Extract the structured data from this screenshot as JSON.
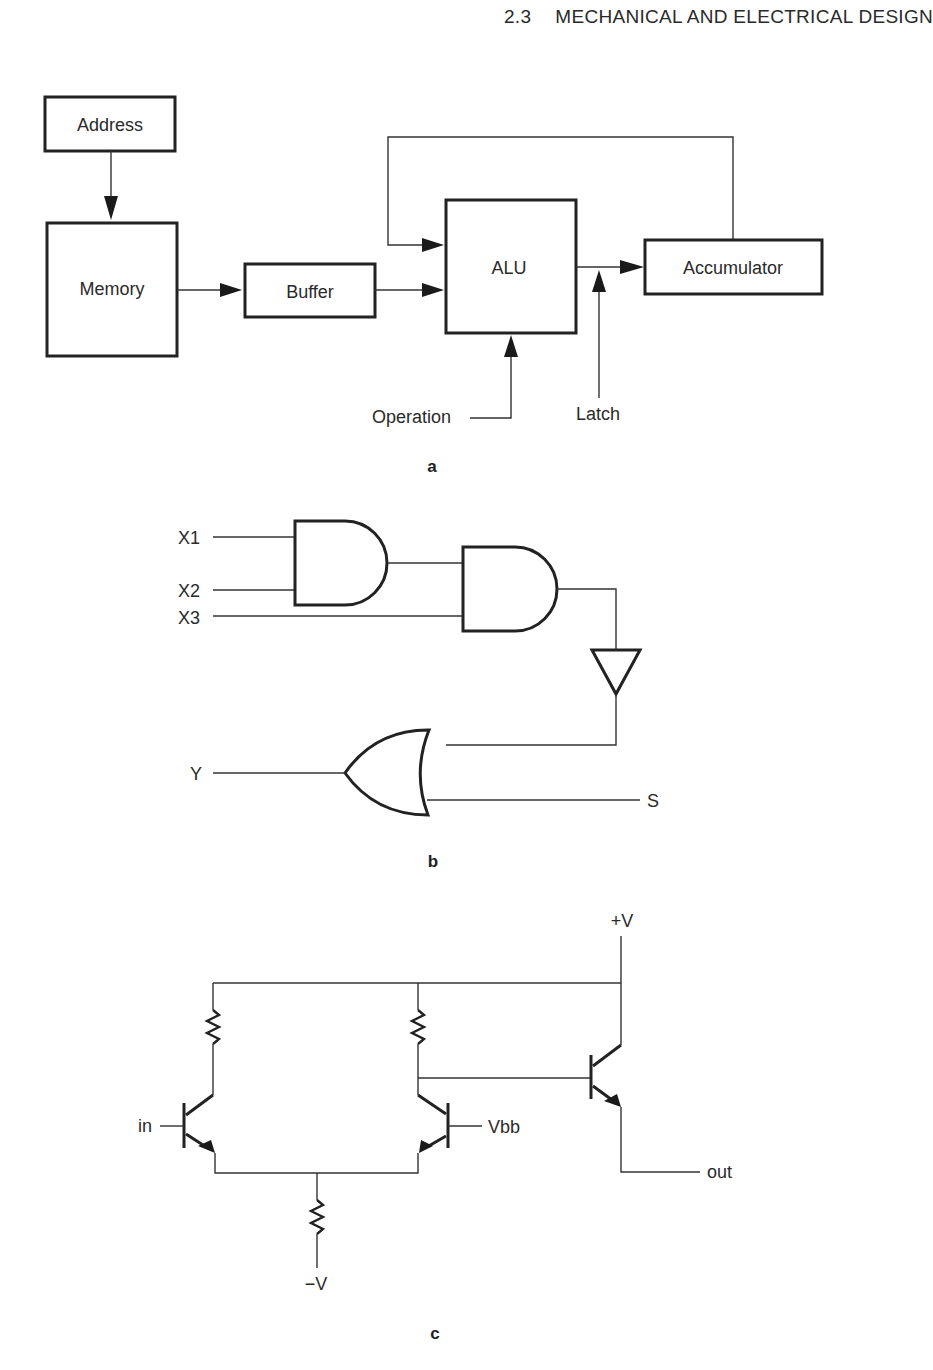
{
  "header": {
    "section_number": "2.3",
    "section_title": "MECHANICAL AND ELECTRICAL DESIGN"
  },
  "figure_a": {
    "caption": "a",
    "blocks": {
      "address": "Address",
      "memory": "Memory",
      "buffer": "Buffer",
      "alu": "ALU",
      "accumulator": "Accumulator"
    },
    "signals": {
      "operation": "Operation",
      "latch": "Latch"
    }
  },
  "figure_b": {
    "caption": "b",
    "inputs": {
      "x1": "X1",
      "x2": "X2",
      "x3": "X3",
      "y": "Y"
    },
    "outputs": {
      "s": "S"
    }
  },
  "figure_c": {
    "caption": "c",
    "labels": {
      "in": "in",
      "vbb": "Vbb",
      "plus_v": "+V",
      "minus_v": "−V",
      "out": "out"
    }
  }
}
